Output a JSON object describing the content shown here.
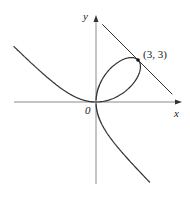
{
  "diagram": {
    "title": "",
    "curve": "x^3 + y^3 = 6xy",
    "origin_px": [
      96,
      102
    ],
    "scale_px_per_unit": 14,
    "axes": {
      "x_label": "x",
      "y_label": "y",
      "origin_label": "0",
      "x_range": [
        -5.9,
        6.0
      ],
      "y_range": [
        -5.8,
        6.0
      ]
    },
    "point": {
      "label": "(3, 3)",
      "x": 3,
      "y": 3
    },
    "tangent_line": {
      "equation": "x + y = 6",
      "x_from": 0.45,
      "x_to": 5.45
    },
    "colors": {
      "axis": "#8a8a8a",
      "curve": "#333333",
      "text": "#222222"
    }
  }
}
